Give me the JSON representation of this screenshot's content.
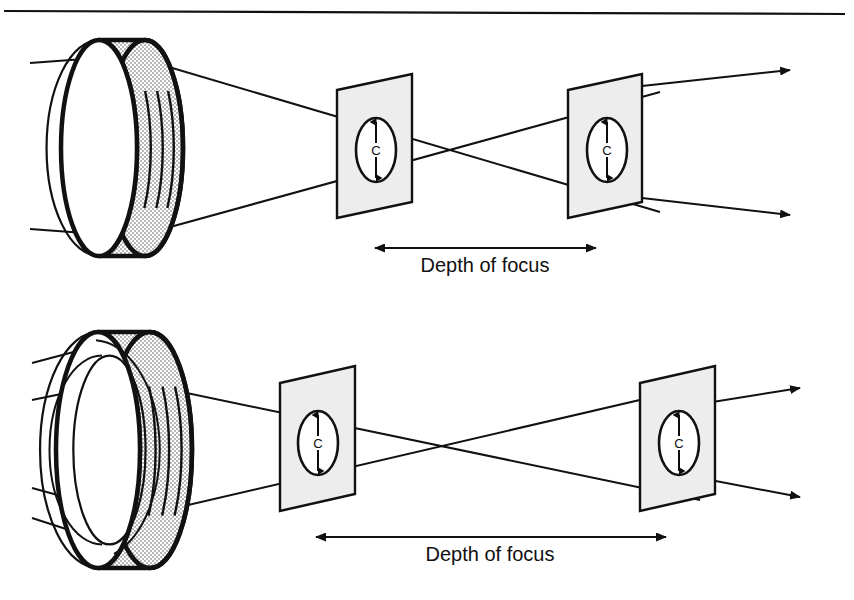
{
  "figure": {
    "background_color": "#ffffff",
    "ink_color": "#111111",
    "plane_fill_color": "#ededed",
    "lens_stipple_color": "#c9c9c9",
    "top_rule": {
      "name": "horizontal-rule",
      "x1": 4,
      "y1": 11,
      "x2": 845,
      "y2": 14,
      "stroke_width": 2
    }
  },
  "diagrams": [
    {
      "id": "top-diagram",
      "caption": "Small aperture lens — long depth of focus",
      "lens": {
        "name": "lens-small-aperture",
        "center_x": 122,
        "center_y": 148,
        "outer_rx": 38,
        "outer_ry": 108,
        "thickness": 46,
        "has_inner_aperture": false,
        "ray_count": 2
      },
      "incoming_rays": [
        {
          "x1": 30,
          "y1": 63,
          "x2": 98,
          "y2": 58
        },
        {
          "x1": 30,
          "y1": 229,
          "x2": 98,
          "y2": 234
        }
      ],
      "cone_rays": [
        {
          "x1": 152,
          "y1": 62,
          "x2": 660,
          "y2": 212
        },
        {
          "x1": 152,
          "y1": 232,
          "x2": 660,
          "y2": 92
        }
      ],
      "exit_rays": [
        {
          "x1": 642,
          "y1": 86,
          "x2": 790,
          "y2": 70
        },
        {
          "x1": 642,
          "y1": 198,
          "x2": 790,
          "y2": 215
        }
      ],
      "crossing_point": {
        "x": 487,
        "y": 152
      },
      "planes": [
        {
          "name": "focus-plane-near",
          "left_x": 337,
          "right_x": 412,
          "top_left_y": 90,
          "top_right_y": 74,
          "height": 128,
          "coc_label": "C",
          "coc_cx": 376,
          "coc_cy": 150,
          "coc_rx": 20,
          "coc_ry": 32
        },
        {
          "name": "focus-plane-far",
          "left_x": 568,
          "right_x": 642,
          "top_left_y": 90,
          "top_right_y": 74,
          "height": 128,
          "coc_label": "C",
          "coc_cx": 607,
          "coc_cy": 150,
          "coc_rx": 20,
          "coc_ry": 32
        }
      ],
      "dimension": {
        "name": "depth-of-focus-measure",
        "label": "Depth of focus",
        "x1": 375,
        "x2": 596,
        "y": 248,
        "label_x": 485,
        "label_y": 272,
        "double_headed": true
      }
    },
    {
      "id": "bottom-diagram",
      "caption": "Large aperture lens — short depth of focus",
      "lens": {
        "name": "lens-large-aperture",
        "center_x": 124,
        "center_y": 450,
        "outer_rx": 42,
        "outer_ry": 118,
        "thickness": 52,
        "has_inner_aperture": true,
        "ray_count": 4
      },
      "incoming_rays": [
        {
          "x1": 32,
          "y1": 363,
          "x2": 100,
          "y2": 345
        },
        {
          "x1": 32,
          "y1": 400,
          "x2": 105,
          "y2": 385
        },
        {
          "x1": 32,
          "y1": 488,
          "x2": 105,
          "y2": 508
        },
        {
          "x1": 32,
          "y1": 518,
          "x2": 100,
          "y2": 540
        }
      ],
      "cone_rays": [
        {
          "x1": 158,
          "y1": 387,
          "x2": 700,
          "y2": 500
        },
        {
          "x1": 158,
          "y1": 512,
          "x2": 700,
          "y2": 386
        }
      ],
      "exit_rays": [
        {
          "x1": 700,
          "y1": 404,
          "x2": 800,
          "y2": 388
        },
        {
          "x1": 700,
          "y1": 478,
          "x2": 800,
          "y2": 497
        }
      ],
      "crossing_point": {
        "x": 492,
        "y": 441
      },
      "planes": [
        {
          "name": "focus-plane-near",
          "left_x": 280,
          "right_x": 355,
          "top_left_y": 383,
          "top_right_y": 366,
          "height": 128,
          "coc_label": "C",
          "coc_cx": 318,
          "coc_cy": 443,
          "coc_rx": 20,
          "coc_ry": 32
        },
        {
          "name": "focus-plane-far",
          "left_x": 640,
          "right_x": 715,
          "top_left_y": 383,
          "top_right_y": 366,
          "height": 128,
          "coc_label": "C",
          "coc_cx": 679,
          "coc_cy": 443,
          "coc_rx": 20,
          "coc_ry": 32
        }
      ],
      "dimension": {
        "name": "depth-of-focus-measure",
        "label": "Depth of focus",
        "x1": 316,
        "x2": 666,
        "y": 537,
        "label_x": 490,
        "label_y": 561,
        "double_headed": true
      }
    }
  ]
}
